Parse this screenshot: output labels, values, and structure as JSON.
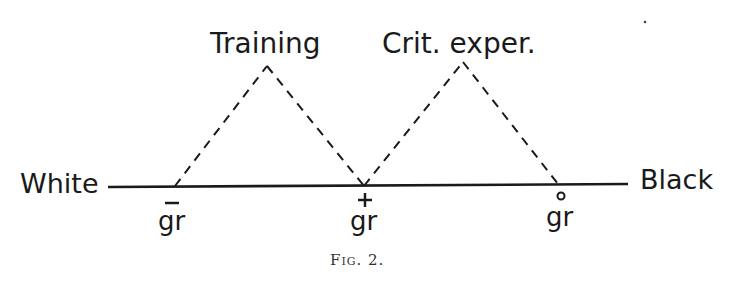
{
  "figure": {
    "caption": "Fig. 2.",
    "axis": {
      "left_label": "White",
      "right_label": "Black"
    },
    "peaks": [
      {
        "label": "Training"
      },
      {
        "label": "Crit. exper."
      }
    ],
    "points": [
      {
        "label": "gr",
        "mark": "‾",
        "mark_name": "bar"
      },
      {
        "label": "gr",
        "mark": "+",
        "mark_name": "plus"
      },
      {
        "label": "gr",
        "mark": "°",
        "mark_name": "circle"
      }
    ]
  }
}
